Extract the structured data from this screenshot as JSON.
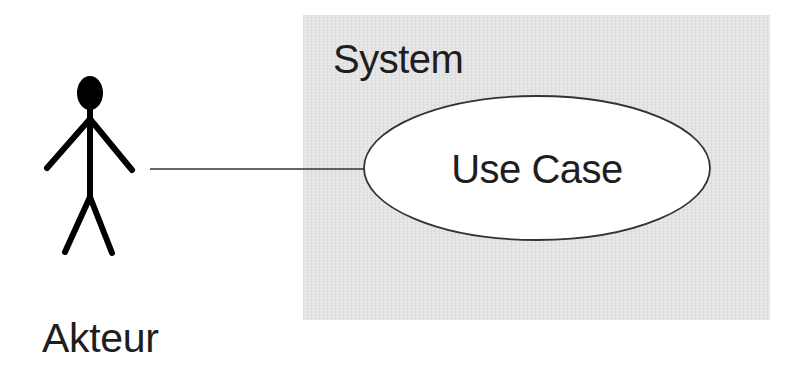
{
  "diagram": {
    "type": "uml-use-case",
    "system": {
      "label": "System",
      "fill_color": "#e4e4e4"
    },
    "use_case": {
      "label": "Use Case",
      "fill_color": "#ffffff",
      "stroke_color": "#333333"
    },
    "actor": {
      "label": "Akteur",
      "icon": "stick-figure-icon",
      "color": "#000000"
    },
    "association": {
      "from": "Akteur",
      "to": "Use Case",
      "stroke_color": "#333333"
    }
  }
}
